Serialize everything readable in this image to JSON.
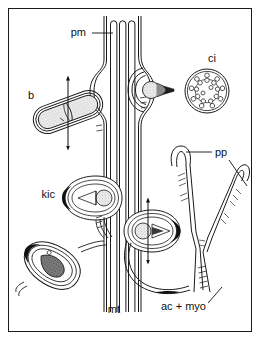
{
  "figure": {
    "kind": "biological-diagram",
    "background_color": "#ffffff",
    "border_color": "#1a1a1a",
    "ink_color": "#1a1a1a",
    "fill_light": "#f2f2f2",
    "fill_stipple": "#d9d9d9",
    "fill_dark": "#4d4d4d",
    "fill_black": "#111111"
  },
  "labels": [
    {
      "id": "pm",
      "text": "pm",
      "meaning": "plasma-membrane",
      "x": 86,
      "y": 36,
      "anchor": "end",
      "leaders": [
        {
          "x1": 92,
          "y1": 33,
          "x2": 113,
          "y2": 33
        }
      ]
    },
    {
      "id": "b",
      "text": "b",
      "meaning": "bacterium",
      "x": 34,
      "y": 99,
      "anchor": "end",
      "leaders": []
    },
    {
      "id": "ci",
      "text": "ci",
      "meaning": "cilium-axoneme-cross-section",
      "x": 212,
      "y": 62,
      "anchor": "middle",
      "leaders": []
    },
    {
      "id": "pp",
      "text": "pp",
      "meaning": "pseudopod",
      "x": 215,
      "y": 156,
      "anchor": "start",
      "leaders": [
        {
          "x1": 212,
          "y1": 152,
          "x2": 186,
          "y2": 152
        },
        {
          "x1": 229,
          "y1": 160,
          "x2": 247,
          "y2": 186
        }
      ]
    },
    {
      "id": "kic",
      "text": "kic",
      "meaning": "killed-ingested-cell",
      "x": 55,
      "y": 198,
      "anchor": "end",
      "leaders": []
    },
    {
      "id": "mt",
      "text": "mt",
      "meaning": "microtubules",
      "x": 120,
      "y": 313,
      "anchor": "end",
      "leaders": []
    },
    {
      "id": "ac-myo",
      "text": "ac + myo",
      "meaning": "actin-plus-myosin-filaments",
      "x": 161,
      "y": 310,
      "anchor": "start",
      "leaders": [
        {
          "x1": 208,
          "y1": 303,
          "x2": 222,
          "y2": 287
        }
      ]
    }
  ],
  "structures": {
    "bacterium_upper": {
      "name": "engulfed-bacterium-capsule",
      "cx": 68,
      "cy": 112,
      "angle": -20
    },
    "phagosome_top": {
      "name": "phagosome-upper-right",
      "cx": 157,
      "cy": 90
    },
    "phagosome_mid": {
      "name": "phagosome-middle",
      "cx": 148,
      "cy": 230
    },
    "phagosome_kic": {
      "name": "phagosome-kic",
      "cx": 90,
      "cy": 198
    },
    "phagosome_lower_left": {
      "name": "phagosome-lower-left",
      "cx": 52,
      "cy": 265
    },
    "axoneme": {
      "name": "axoneme-cross-section",
      "cx": 207,
      "cy": 91,
      "r": 22,
      "doublets": 9,
      "central_singlets": 2
    },
    "pseudopod": {
      "name": "pseudopod-y-shape",
      "cx": 205,
      "cy": 215
    },
    "microtubule_bundle": {
      "name": "microtubule-bundle",
      "x": 108,
      "y_top": 16,
      "y_bottom": 312,
      "count": 3
    }
  },
  "arrows": [
    {
      "name": "arrow-bacterium-vertical",
      "x": 68,
      "y1": 78,
      "y2": 148,
      "double": true
    },
    {
      "name": "arrow-phagosome-mid-vertical",
      "x": 148,
      "y1": 200,
      "y2": 262,
      "double": true
    }
  ]
}
